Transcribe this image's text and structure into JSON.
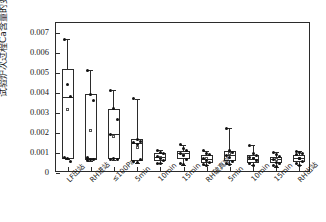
{
  "chart_data": {
    "type": "box",
    "title": "",
    "xlabel": "",
    "ylabel": "试验炉次过程Ca含量的变化/%",
    "ylim": [
      0,
      0.0075
    ],
    "yticks": [
      0,
      0.001,
      0.002,
      0.003,
      0.004,
      0.005,
      0.006,
      0.007
    ],
    "ytick_labels": [
      "0",
      "0.001",
      "0.002",
      "0.003",
      "0.004",
      "0.005",
      "0.006",
      "0.007"
    ],
    "grid": false,
    "legend": null,
    "categories": [
      "LF出站",
      "RH进站",
      "≤100Pa",
      "5min",
      "10min",
      "15min",
      "RH破真空",
      "5min",
      "10min",
      "15min",
      "RH出站"
    ],
    "boxes": [
      {
        "category": "LF出站",
        "whisker_low": 0.00068,
        "q1": 0.00072,
        "median": 0.00382,
        "q3": 0.0052,
        "whisker_high": 0.0067,
        "mean": 0.00318,
        "points": [
          0.0067,
          0.00445,
          0.00382,
          0.0008,
          0.00072,
          0.0006
        ]
      },
      {
        "category": "RH进站",
        "whisker_low": 0.00062,
        "q1": 0.00068,
        "median": 0.00072,
        "q3": 0.00395,
        "whisker_high": 0.00515,
        "mean": 0.00215,
        "points": [
          0.00515,
          0.00395,
          0.00365,
          0.00078,
          0.0007,
          0.00066,
          0.00062
        ]
      },
      {
        "category": "≤100Pa",
        "whisker_low": 0.00066,
        "q1": 0.0007,
        "median": 0.00195,
        "q3": 0.00322,
        "whisker_high": 0.00415,
        "mean": 0.00185,
        "points": [
          0.00415,
          0.00322,
          0.00268,
          0.00195,
          0.00075,
          0.0007,
          0.00066
        ]
      },
      {
        "category": "5min",
        "whisker_low": 0.00052,
        "q1": 0.00062,
        "median": 0.00152,
        "q3": 0.00168,
        "whisker_high": 0.00372,
        "mean": 0.00128,
        "points": [
          0.00372,
          0.00168,
          0.00158,
          0.00152,
          0.00145,
          0.0007,
          0.00058,
          0.00052
        ]
      },
      {
        "category": "10min",
        "whisker_low": 0.00048,
        "q1": 0.00062,
        "median": 0.00082,
        "q3": 0.00098,
        "whisker_high": 0.00115,
        "mean": 0.0008,
        "points": [
          0.00115,
          0.00105,
          0.00098,
          0.00082,
          0.00072,
          0.00062,
          0.0005,
          0.00048
        ]
      },
      {
        "category": "15min",
        "whisker_low": 0.00042,
        "q1": 0.00068,
        "median": 0.00098,
        "q3": 0.00112,
        "whisker_high": 0.00142,
        "mean": 0.00092,
        "points": [
          0.00142,
          0.00125,
          0.00112,
          0.00098,
          0.00088,
          0.00068,
          0.0005,
          0.00042
        ]
      },
      {
        "category": "RH破真空",
        "whisker_low": 0.0004,
        "q1": 0.00052,
        "median": 0.00072,
        "q3": 0.00092,
        "whisker_high": 0.00112,
        "mean": 0.00072,
        "points": [
          0.00112,
          0.00098,
          0.00092,
          0.00072,
          0.00062,
          0.00052,
          0.00045,
          0.0004
        ]
      },
      {
        "category": "5min",
        "whisker_low": 0.00045,
        "q1": 0.00058,
        "median": 0.0009,
        "q3": 0.00112,
        "whisker_high": 0.00225,
        "mean": 0.00098,
        "points": [
          0.00225,
          0.00112,
          0.00105,
          0.0009,
          0.00078,
          0.00058,
          0.0005,
          0.00045
        ]
      },
      {
        "category": "10min",
        "whisker_low": 0.00038,
        "q1": 0.00048,
        "median": 0.00072,
        "q3": 0.0009,
        "whisker_high": 0.00138,
        "mean": 0.00074,
        "points": [
          0.00138,
          0.00098,
          0.0009,
          0.0008,
          0.00072,
          0.00062,
          0.00048,
          0.00038
        ]
      },
      {
        "category": "15min",
        "whisker_low": 0.00032,
        "q1": 0.00048,
        "median": 0.00068,
        "q3": 0.00082,
        "whisker_high": 0.00105,
        "mean": 0.00068,
        "points": [
          0.00105,
          0.00092,
          0.00082,
          0.00068,
          0.00055,
          0.00048,
          0.0004,
          0.00032
        ]
      },
      {
        "category": "RH出站",
        "whisker_low": 0.0004,
        "q1": 0.00055,
        "median": 0.00075,
        "q3": 0.00092,
        "whisker_high": 0.00108,
        "mean": 0.00075,
        "points": [
          0.00108,
          0.00105,
          0.001,
          0.00092,
          0.00075,
          0.00058,
          0.0005,
          0.0004
        ]
      }
    ],
    "markers": {
      "data_point": "filled-circle",
      "mean": "open-square",
      "box_edge_color": "#2b2b2b",
      "point_color": "#111111"
    }
  }
}
